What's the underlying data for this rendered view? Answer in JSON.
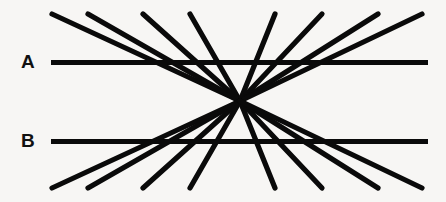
{
  "figure": {
    "name": "hering-illusion",
    "width": 446,
    "height": 202,
    "background_color": "#f7f6f4",
    "line_color": "#0a0a0a",
    "fan_stroke_width": 5.2,
    "parallel_stroke_width": 5.0
  },
  "labels": [
    {
      "id": "label-a",
      "text": "A",
      "x": 21,
      "y": 52
    },
    {
      "id": "label-b",
      "text": "B",
      "x": 21,
      "y": 131
    }
  ],
  "chart_data": {
    "type": "line",
    "xlabel": "",
    "ylabel": "",
    "grid": false,
    "legend": "none",
    "xlim": [
      0,
      446
    ],
    "ylim": [
      0,
      202
    ],
    "convergence_point": {
      "x": 240,
      "y": 101
    },
    "parallel_lines": [
      {
        "label": "A",
        "x1": 51,
        "y1": 62.5,
        "x2": 428,
        "y2": 62.5
      },
      {
        "label": "B",
        "x1": 51,
        "y1": 141.5,
        "x2": 428,
        "y2": 141.5
      }
    ],
    "radial_lines": [
      {
        "index": 1,
        "x1": 52,
        "y1": 14,
        "x2": 240,
        "y2": 101
      },
      {
        "index": 2,
        "x1": 88,
        "y1": 14,
        "x2": 240,
        "y2": 101
      },
      {
        "index": 3,
        "x1": 143,
        "y1": 14,
        "x2": 240,
        "y2": 101
      },
      {
        "index": 4,
        "x1": 190,
        "y1": 14,
        "x2": 240,
        "y2": 101
      },
      {
        "index": 5,
        "x1": 275,
        "y1": 14,
        "x2": 240,
        "y2": 101
      },
      {
        "index": 6,
        "x1": 322,
        "y1": 14,
        "x2": 240,
        "y2": 101
      },
      {
        "index": 7,
        "x1": 378,
        "y1": 14,
        "x2": 240,
        "y2": 101
      },
      {
        "index": 8,
        "x1": 422,
        "y1": 14,
        "x2": 240,
        "y2": 101
      },
      {
        "index": 9,
        "x1": 52,
        "y1": 188,
        "x2": 240,
        "y2": 101
      },
      {
        "index": 10,
        "x1": 88,
        "y1": 188,
        "x2": 240,
        "y2": 101
      },
      {
        "index": 11,
        "x1": 143,
        "y1": 188,
        "x2": 240,
        "y2": 101
      },
      {
        "index": 12,
        "x1": 190,
        "y1": 188,
        "x2": 240,
        "y2": 101
      },
      {
        "index": 13,
        "x1": 275,
        "y1": 188,
        "x2": 240,
        "y2": 101
      },
      {
        "index": 14,
        "x1": 322,
        "y1": 188,
        "x2": 240,
        "y2": 101
      },
      {
        "index": 15,
        "x1": 378,
        "y1": 188,
        "x2": 240,
        "y2": 101
      },
      {
        "index": 16,
        "x1": 422,
        "y1": 188,
        "x2": 240,
        "y2": 101
      }
    ]
  }
}
